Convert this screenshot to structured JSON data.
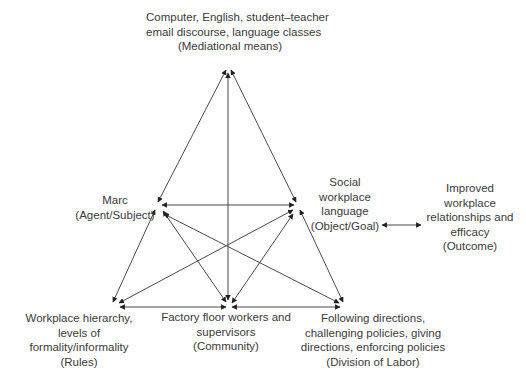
{
  "diagram": {
    "type": "activity-system-triangle",
    "nodes": {
      "mediational_means": {
        "lines": [
          "Computer, English, student–teacher",
          "email discourse, language classes",
          "(Mediational means)"
        ]
      },
      "subject": {
        "lines": [
          "Marc",
          "(Agent/Subject)"
        ]
      },
      "object": {
        "lines": [
          "Social",
          "workplace",
          "language",
          "(Object/Goal)"
        ]
      },
      "outcome": {
        "lines": [
          "Improved",
          "workplace",
          "relationships and",
          "efficacy",
          "(Outcome)"
        ]
      },
      "rules": {
        "lines": [
          "Workplace hierarchy,",
          "levels of",
          "formality/informality",
          "(Rules)"
        ]
      },
      "community": {
        "lines": [
          "Factory floor workers and",
          "supervisors",
          "(Community)"
        ]
      },
      "division_of_labor": {
        "lines": [
          "Following directions,",
          "challenging policies, giving",
          "directions, enforcing policies",
          "(Division of Labor)"
        ]
      }
    },
    "edges": [
      {
        "from": "mediational_means",
        "to": "subject",
        "bidirectional": true
      },
      {
        "from": "mediational_means",
        "to": "object",
        "bidirectional": true
      },
      {
        "from": "mediational_means",
        "to": "community",
        "bidirectional": true
      },
      {
        "from": "subject",
        "to": "object",
        "bidirectional": true
      },
      {
        "from": "subject",
        "to": "rules",
        "bidirectional": true
      },
      {
        "from": "subject",
        "to": "community",
        "bidirectional": true
      },
      {
        "from": "subject",
        "to": "division_of_labor",
        "bidirectional": true
      },
      {
        "from": "object",
        "to": "rules",
        "bidirectional": true
      },
      {
        "from": "object",
        "to": "community",
        "bidirectional": true
      },
      {
        "from": "object",
        "to": "division_of_labor",
        "bidirectional": true
      },
      {
        "from": "rules",
        "to": "community",
        "bidirectional": true
      },
      {
        "from": "community",
        "to": "division_of_labor",
        "bidirectional": true
      },
      {
        "from": "object",
        "to": "outcome",
        "bidirectional": true
      }
    ],
    "colors": {
      "line": "#4a4a4a",
      "text": "#3a3a3a",
      "background": "#ffffff"
    }
  }
}
